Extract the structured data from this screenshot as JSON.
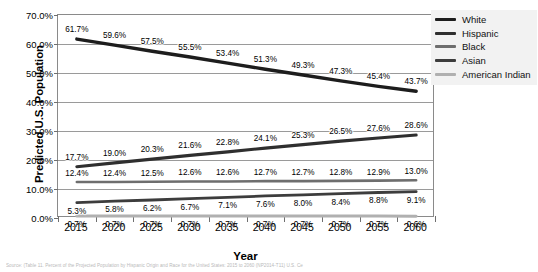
{
  "chart_data": {
    "type": "line",
    "title": "",
    "xlabel": "Year",
    "ylabel": "Predicted U.S. Population",
    "categories": [
      "2015",
      "2020",
      "2025",
      "2030",
      "2035",
      "2040",
      "2045",
      "2050",
      "2055",
      "2060"
    ],
    "ylim": [
      0,
      70
    ],
    "ytick_labels": [
      "0.0%",
      "10.0%",
      "20.0%",
      "30.0%",
      "40.0%",
      "50.0%",
      "60.0%",
      "70.0%"
    ],
    "ytick_values": [
      0,
      10,
      20,
      30,
      40,
      50,
      60,
      70
    ],
    "grid": true,
    "legend_position": "top-right",
    "series": [
      {
        "name": "White",
        "color": "#1d1d1d",
        "width": 3.4,
        "values": [
          61.7,
          59.6,
          57.5,
          55.5,
          53.4,
          51.3,
          49.3,
          47.3,
          45.4,
          43.7
        ],
        "labels": [
          "61.7%",
          "59.6%",
          "57.5%",
          "55.5%",
          "53.4%",
          "51.3%",
          "49.3%",
          "47.3%",
          "45.4%",
          "43.7%"
        ]
      },
      {
        "name": "Hispanic",
        "color": "#2f2f2f",
        "width": 3.1,
        "values": [
          17.7,
          19.0,
          20.3,
          21.6,
          22.8,
          24.1,
          25.3,
          26.5,
          27.6,
          28.6
        ],
        "labels": [
          "17.7%",
          "19.0%",
          "20.3%",
          "21.6%",
          "22.8%",
          "24.1%",
          "25.3%",
          "26.5%",
          "27.6%",
          "28.6%"
        ]
      },
      {
        "name": "Black",
        "color": "#6e6e6e",
        "width": 2.6,
        "values": [
          12.4,
          12.4,
          12.5,
          12.6,
          12.6,
          12.7,
          12.7,
          12.8,
          12.9,
          13.0
        ],
        "labels": [
          "12.4%",
          "12.4%",
          "12.5%",
          "12.6%",
          "12.6%",
          "12.7%",
          "12.7%",
          "12.8%",
          "12.9%",
          "13.0%"
        ]
      },
      {
        "name": "Asian",
        "color": "#3d3d3d",
        "width": 2.8,
        "values": [
          5.3,
          5.8,
          6.2,
          6.7,
          7.1,
          7.6,
          8.0,
          8.4,
          8.8,
          9.1
        ],
        "labels": [
          "5.3%",
          "5.8%",
          "6.2%",
          "6.7%",
          "7.1%",
          "7.6%",
          "8.0%",
          "8.4%",
          "8.8%",
          "9.1%"
        ]
      },
      {
        "name": "American Indian",
        "color": "#b0b0b0",
        "width": 3.0,
        "values": [
          0.7,
          0.7,
          0.7,
          0.7,
          0.7,
          0.7,
          0.7,
          0.7,
          0.7,
          0.6
        ],
        "labels": [
          "0.7%",
          "0.7%",
          "0.7%",
          "0.7%",
          "0.7%",
          "0.7%",
          "0.7%",
          "0.7%",
          "0.7%",
          "0.6%"
        ]
      }
    ]
  },
  "legend": {
    "items": [
      {
        "label": "White"
      },
      {
        "label": "Hispanic"
      },
      {
        "label": "Black"
      },
      {
        "label": "Asian"
      },
      {
        "label": "American Indian"
      }
    ]
  },
  "source": {
    "text": "Source: (Table 11. Percent of the Projected Population by Hispanic Origin and Race for the United States: 2015 to 2060 (NP2014-T11) U.S. Ce"
  }
}
